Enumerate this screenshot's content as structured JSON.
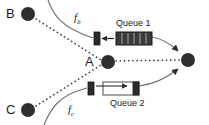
{
  "figure": {
    "type": "queueing-network-diagram",
    "background": "#ffffff",
    "ink_color": "#1a1a1a",
    "curve_color": "#6e6e6e",
    "width": 209,
    "height": 125
  },
  "nodes": [
    {
      "id": "B",
      "label": "B",
      "label_x": 6,
      "label_y": 7,
      "cx": 28,
      "cy": 14,
      "r": 7
    },
    {
      "id": "A",
      "label": "A",
      "label_x": 83,
      "label_y": 55,
      "cx": 108,
      "cy": 62,
      "r": 7
    },
    {
      "id": "C",
      "label": "C",
      "label_x": 6,
      "label_y": 103,
      "cx": 28,
      "cy": 110,
      "r": 7
    },
    {
      "id": "D",
      "label": "",
      "label_x": 0,
      "label_y": 0,
      "cx": 188,
      "cy": 60,
      "r": 7
    }
  ],
  "flows": [
    {
      "id": "fb",
      "label": "f",
      "sub": "b",
      "label_x": 74,
      "label_y": 12
    },
    {
      "id": "fc",
      "label": "f",
      "sub": "c",
      "label_x": 68,
      "label_y": 104
    }
  ],
  "queues": [
    {
      "id": "queue1",
      "label": "Queue 1",
      "label_x": 116,
      "label_y": 19,
      "style": "filled",
      "slots": 5,
      "box_x": 116,
      "box_y": 32,
      "box_w": 36,
      "box_h": 13,
      "server_x": 94,
      "server_y": 32,
      "server_w": 6,
      "server_h": 13
    },
    {
      "id": "queue2",
      "label": "Queue 2",
      "label_x": 110,
      "label_y": 99,
      "style": "empty",
      "slots": 0,
      "box_x": 103,
      "box_y": 82,
      "box_w": 36,
      "box_h": 13,
      "server_x": 88,
      "server_y": 82,
      "server_w": 6,
      "server_h": 13
    }
  ],
  "edges": [
    {
      "id": "b-to-a",
      "style": "dotted",
      "from": "B",
      "to": "A"
    },
    {
      "id": "c-to-a",
      "style": "dotted",
      "from": "C",
      "to": "A"
    },
    {
      "id": "a-to-d",
      "style": "dotted",
      "from": "A",
      "to": "D"
    },
    {
      "id": "fb-in",
      "style": "solid-curve",
      "from": "top-edge",
      "to": "queue1-server"
    },
    {
      "id": "fc-in",
      "style": "solid-curve",
      "from": "bottom-edge",
      "to": "queue2-server"
    },
    {
      "id": "q1-out",
      "style": "solid-arrow",
      "from": "queue1",
      "to": "D"
    },
    {
      "id": "q2-out",
      "style": "solid-arrow",
      "from": "queue2",
      "to": "D"
    }
  ]
}
